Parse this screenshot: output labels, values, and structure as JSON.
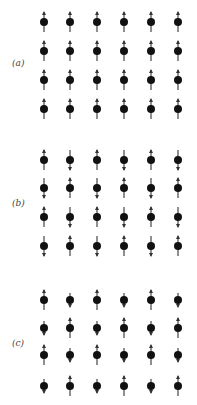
{
  "figure": {
    "colors": {
      "atom": "#111111",
      "arrow": "#333333",
      "label": "#444444"
    },
    "columns_x": [
      44,
      70,
      97,
      124,
      151,
      178
    ],
    "panels": [
      {
        "label": "(a)",
        "label_y": 66,
        "rows_y": [
          22,
          51,
          80,
          109
        ],
        "spins": [
          [
            "up",
            "up",
            "up",
            "up",
            "up",
            "up"
          ],
          [
            "up",
            "up",
            "up",
            "up",
            "up",
            "up"
          ],
          [
            "up",
            "up",
            "up",
            "up",
            "up",
            "up"
          ],
          [
            "up",
            "up",
            "up",
            "up",
            "up",
            "up"
          ]
        ],
        "magnitude_up": 1.0,
        "magnitude_down": 1.0
      },
      {
        "label": "(b)",
        "label_y": 206,
        "rows_y": [
          160,
          188,
          217,
          246
        ],
        "spins": [
          [
            "up",
            "down",
            "up",
            "down",
            "up",
            "down"
          ],
          [
            "down",
            "up",
            "down",
            "up",
            "down",
            "up"
          ],
          [
            "up",
            "down",
            "up",
            "down",
            "up",
            "down"
          ],
          [
            "down",
            "up",
            "down",
            "up",
            "down",
            "up"
          ]
        ],
        "magnitude_up": 1.0,
        "magnitude_down": 1.0
      },
      {
        "label": "(c)",
        "label_y": 346,
        "rows_y": [
          300,
          328,
          355,
          386
        ],
        "spins": [
          [
            "up",
            "down",
            "up",
            "down",
            "up",
            "down"
          ],
          [
            "down",
            "up",
            "down",
            "up",
            "down",
            "up"
          ],
          [
            "up",
            "down",
            "up",
            "down",
            "up",
            "down"
          ],
          [
            "down",
            "up",
            "down",
            "up",
            "down",
            "up"
          ]
        ],
        "magnitude_up": 1.0,
        "magnitude_down": 0.7
      }
    ]
  }
}
